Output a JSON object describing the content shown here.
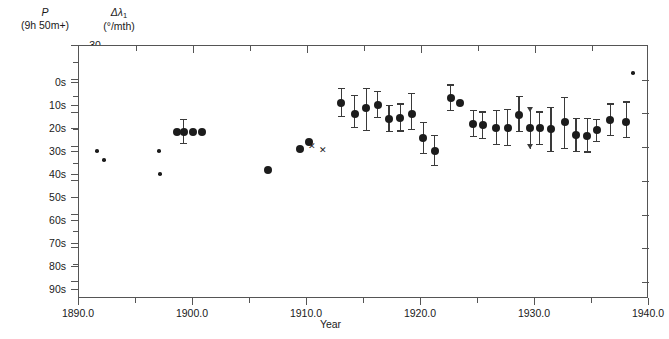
{
  "axes": {
    "left_outer": {
      "title_line1": "P",
      "title_line2": "(9h 50m+)",
      "ticks": [
        "0s",
        "10s",
        "20s",
        "30s",
        "40s",
        "50s",
        "60s",
        "70s",
        "80s",
        "90s"
      ],
      "values": [
        0,
        10,
        20,
        30,
        40,
        50,
        60,
        70,
        80,
        90
      ]
    },
    "left_inner": {
      "title_line1": "Δλ",
      "title_sub": "1",
      "title_line2": "(°/mth)",
      "ticks": [
        "−30",
        "−20",
        "−10",
        "0",
        "+10",
        "+20",
        "+30",
        "+40"
      ],
      "values": [
        -30,
        -20,
        -10,
        0,
        10,
        20,
        30,
        40
      ]
    },
    "x": {
      "title": "Year",
      "ticks": [
        "1890.0",
        "1900.0",
        "1910.0",
        "1920.0",
        "1930.0",
        "1940.0"
      ],
      "values": [
        1890,
        1900,
        1910,
        1920,
        1930,
        1940
      ],
      "minor_step": 5
    }
  },
  "chart_data": {
    "type": "scatter",
    "title": "",
    "xlabel": "Year",
    "ylabel": "Δλ1 (°/mth)",
    "ylabel_secondary": "P (9h 50m+) seconds",
    "xlim": [
      1890.0,
      1940.0
    ],
    "ylim": [
      -30,
      45
    ],
    "ylim_secondary": [
      -3,
      97.5
    ],
    "grid": false,
    "legend": "none",
    "series": [
      {
        "name": "single observations (no error estimate)",
        "marker": "small-dot",
        "points": [
          {
            "x": 1891.6,
            "y": 1.2
          },
          {
            "x": 1892.2,
            "y": 3.8
          },
          {
            "x": 1897.0,
            "y": 1.2
          },
          {
            "x": 1897.1,
            "y": 8.0
          },
          {
            "x": 1938.6,
            "y": -22.0
          }
        ]
      },
      {
        "name": "mean values with error bars",
        "marker": "filled-circle",
        "points": [
          {
            "x": 1898.6,
            "y": -4.6
          },
          {
            "x": 1899.2,
            "y": -4.6,
            "err_low": -1.0,
            "err_high": -8.4
          },
          {
            "x": 1900.0,
            "y": -4.6
          },
          {
            "x": 1900.8,
            "y": -4.6
          },
          {
            "x": 1906.6,
            "y": 6.8
          },
          {
            "x": 1909.4,
            "y": 0.6
          },
          {
            "x": 1910.2,
            "y": -1.4
          },
          {
            "x": 1913.0,
            "y": -13.0,
            "err_low": -9.0,
            "err_high": -17.6
          },
          {
            "x": 1914.2,
            "y": -9.8,
            "err_low": -5.6,
            "err_high": -15.4
          },
          {
            "x": 1915.2,
            "y": -11.6,
            "err_low": -4.8,
            "err_high": -17.6
          },
          {
            "x": 1916.2,
            "y": -12.4,
            "err_low": -8.6,
            "err_high": -16.6
          },
          {
            "x": 1917.2,
            "y": -8.4,
            "err_low": -4.4,
            "err_high": -12.6
          },
          {
            "x": 1918.2,
            "y": -8.6,
            "err_low": -4.6,
            "err_high": -13.0
          },
          {
            "x": 1919.2,
            "y": -9.8,
            "err_low": -5.0,
            "err_high": -16.0
          },
          {
            "x": 1920.2,
            "y": -2.6,
            "err_low": 2.0,
            "err_high": -7.4
          },
          {
            "x": 1921.2,
            "y": 1.0,
            "err_low": 5.6,
            "err_high": -3.6
          },
          {
            "x": 1922.6,
            "y": -14.6,
            "err_low": -10.6,
            "err_high": -18.6
          },
          {
            "x": 1923.4,
            "y": -13.2
          },
          {
            "x": 1924.6,
            "y": -7.0,
            "err_low": -3.0,
            "err_high": -11.0
          },
          {
            "x": 1925.4,
            "y": -6.6,
            "err_low": -2.4,
            "err_high": -10.6
          },
          {
            "x": 1926.6,
            "y": -5.6,
            "err_low": -0.6,
            "err_high": -11.0
          },
          {
            "x": 1927.6,
            "y": -5.6,
            "err_low": -0.4,
            "err_high": -11.4
          },
          {
            "x": 1928.6,
            "y": -9.6,
            "err_low": -4.4,
            "err_high": -15.2
          },
          {
            "x": 1929.6,
            "y": -5.6,
            "err_low": 0.4,
            "err_high": -11.8,
            "limit": "down"
          },
          {
            "x": 1930.4,
            "y": -5.6,
            "err_low": -0.6,
            "err_high": -10.6
          },
          {
            "x": 1931.4,
            "y": -5.4,
            "err_low": 1.4,
            "err_high": -12.0
          },
          {
            "x": 1932.6,
            "y": -7.6,
            "err_low": 0.6,
            "err_high": -15.0
          },
          {
            "x": 1933.6,
            "y": -3.6,
            "err_low": 1.4,
            "err_high": -8.6
          },
          {
            "x": 1934.6,
            "y": -3.4,
            "err_low": 1.6,
            "err_high": -8.6
          },
          {
            "x": 1935.4,
            "y": -5.0,
            "err_low": -1.6,
            "err_high": -8.4
          },
          {
            "x": 1936.6,
            "y": -8.0,
            "err_low": -3.4,
            "err_high": -13.0
          },
          {
            "x": 1938.0,
            "y": -7.6,
            "err_low": -2.6,
            "err_high": -13.6
          }
        ]
      },
      {
        "name": "cross observations",
        "marker": "cross",
        "points": [
          {
            "x": 1910.4,
            "y": -0.2
          },
          {
            "x": 1911.4,
            "y": 1.2
          }
        ]
      }
    ]
  }
}
